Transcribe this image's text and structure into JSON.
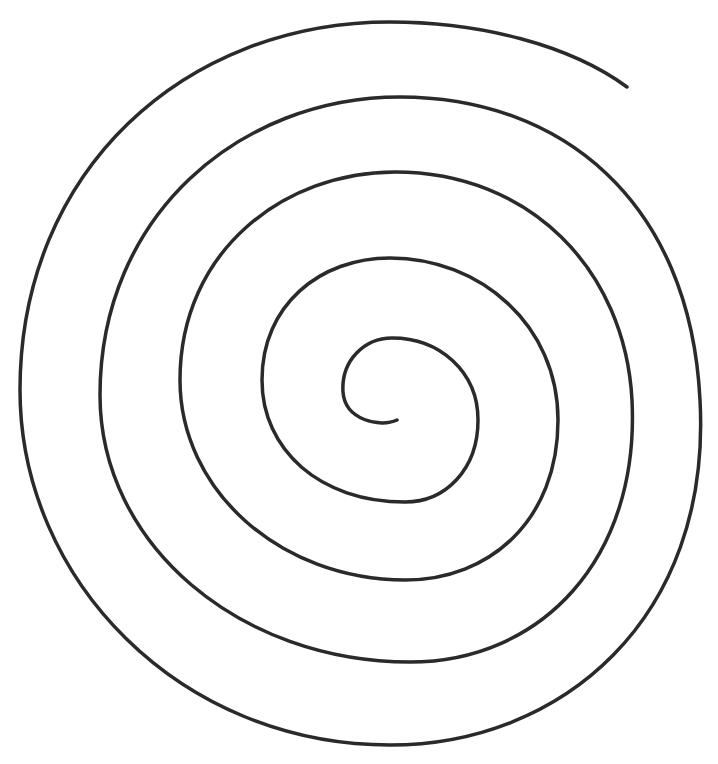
{
  "figure": {
    "stroke_color": "#2a2a2a",
    "background_color": "#ffffff",
    "turns": 5
  }
}
